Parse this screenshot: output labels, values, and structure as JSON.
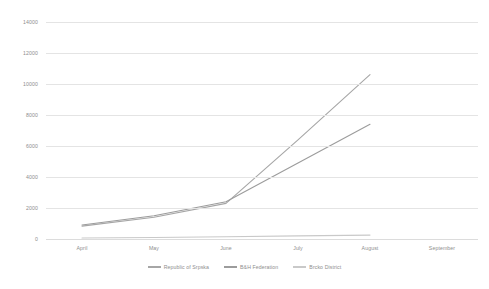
{
  "chart_data": {
    "type": "line",
    "title": "",
    "subtitle": "",
    "xlabel": "",
    "ylabel": "",
    "categories": [
      "April",
      "May",
      "June",
      "July",
      "August",
      "September"
    ],
    "ylim": [
      0,
      14000
    ],
    "yticks": [
      0,
      2000,
      4000,
      6000,
      8000,
      10000,
      12000,
      14000
    ],
    "ytick_labels": [
      "0",
      "2000",
      "4000",
      "6000",
      "8000",
      "10000",
      "12000",
      "14000"
    ],
    "grid": true,
    "legend_position": "bottom",
    "series": [
      {
        "name": "Republic of Srpska",
        "color": "#a6a6a6",
        "values": [
          830,
          1400,
          2300,
          6400,
          10600,
          null
        ]
      },
      {
        "name": "B&H Federation",
        "color": "#9c9c9c",
        "values": [
          900,
          1500,
          2400,
          4900,
          7400,
          null
        ]
      },
      {
        "name": "Brcko District",
        "color": "#c9c9c9",
        "values": [
          60,
          100,
          150,
          200,
          250,
          null
        ]
      }
    ]
  },
  "legend": {
    "items": [
      {
        "label": "Republic of Srpska",
        "color": "#a6a6a6"
      },
      {
        "label": "B&H Federation",
        "color": "#9c9c9c"
      },
      {
        "label": "Brcko District",
        "color": "#c9c9c9"
      }
    ]
  }
}
